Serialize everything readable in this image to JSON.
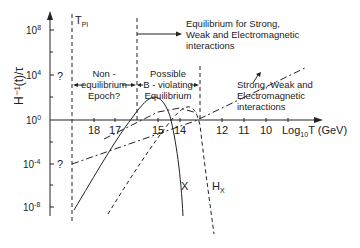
{
  "diagram": {
    "y_axis": {
      "label": "H⁻¹(t)/τ",
      "ticks": [
        {
          "label": "10",
          "exp": "8",
          "y": 30
        },
        {
          "label": "10",
          "exp": "4",
          "y": 75
        },
        {
          "label": "10",
          "exp": "0",
          "y": 120
        },
        {
          "label": "10",
          "exp": "-4",
          "y": 164
        },
        {
          "label": "10",
          "exp": "-8",
          "y": 207
        }
      ],
      "question_marks": [
        "?",
        "?"
      ]
    },
    "x_axis": {
      "label_prefix": "Log",
      "label_sub": "10",
      "label_suffix": "T (GeV)",
      "ticks": [
        "18",
        "17",
        "15",
        "14",
        "12",
        "11",
        "10"
      ]
    },
    "planck_label": "T",
    "planck_sub": "Pl",
    "regions": {
      "non_eq_line1": "Non -",
      "non_eq_line2": "equilibrium",
      "non_eq_line3": "Epoch?",
      "bviol_line1": "Possible",
      "bviol_line2": "B - violating",
      "bviol_line3": "Equilibrium",
      "eq_line1": "Equilibrium for Strong,",
      "eq_line2": "Weak and Electromagnetic",
      "eq_line3": "interactions"
    },
    "curve_annotation": {
      "line1": "Strong, Weak and",
      "line2": "Electromagnetic",
      "line3": "interactions"
    },
    "curve_labels": {
      "x": "X",
      "hx": "H",
      "hx_sub": "X"
    },
    "colors": {
      "ink": "#222222",
      "background": "#ffffff"
    }
  }
}
